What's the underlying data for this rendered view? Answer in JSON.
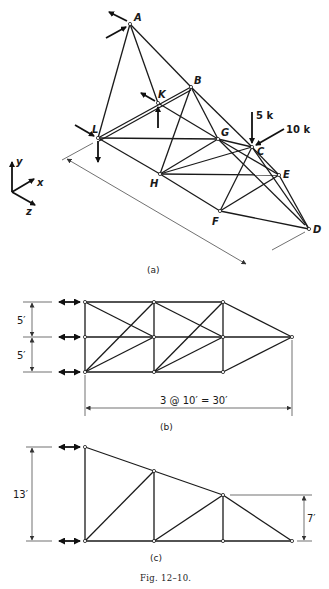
{
  "figure": {
    "caption": "Fig. 12–10.",
    "part_a": {
      "label": "(a)",
      "nodes": {
        "A": "A",
        "B": "B",
        "C": "C",
        "D": "D",
        "E": "E",
        "F": "F",
        "G": "G",
        "H": "H",
        "K": "K",
        "L": "L"
      },
      "loads": {
        "vertical_at_C": "5 k",
        "inclined_at_C": "10 k"
      },
      "axes": {
        "x": "x",
        "y": "y",
        "z": "z"
      }
    },
    "part_b": {
      "label": "(b)",
      "dim_upper": "5′",
      "dim_lower": "5′",
      "dim_span": "3 @ 10′ = 30′"
    },
    "part_c": {
      "label": "(c)",
      "dim_left_height": "13′",
      "dim_right_height": "7′"
    }
  }
}
